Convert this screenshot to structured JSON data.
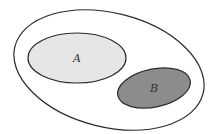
{
  "diagram": {
    "type": "venn",
    "universe": {
      "label": "",
      "fill": "#ffffff",
      "stroke": "#2a2a2a"
    },
    "sets": [
      {
        "id": "A",
        "label": "A",
        "fill": "#e6e6e6",
        "stroke": "#2a2a2a"
      },
      {
        "id": "B",
        "label": "B",
        "fill": "#8c8c8c",
        "stroke": "#2a2a2a"
      }
    ],
    "relation": "disjoint"
  }
}
